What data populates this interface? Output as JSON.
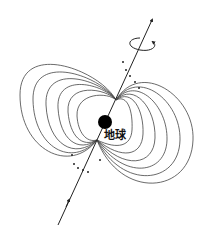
{
  "diagram": {
    "earth_label": "地球",
    "colors": {
      "line": "#444444",
      "earth": "#000000",
      "background": "#ffffff"
    },
    "axis": {
      "start": [
        58,
        225
      ],
      "end": [
        152,
        20
      ]
    },
    "earth_center": [
      105,
      122
    ],
    "upper_convergence": [
      116,
      100
    ],
    "lower_convergence": [
      97,
      140
    ],
    "field_line_count_per_side": 7,
    "icons": [
      "rotation-arrow-icon",
      "axis-arrow-icon",
      "earth-dot-icon"
    ]
  }
}
